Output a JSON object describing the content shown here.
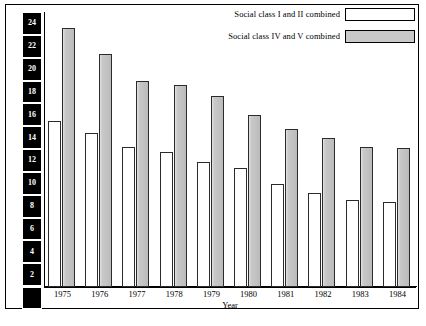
{
  "legend": {
    "items": [
      {
        "label": "Social class I and II combined",
        "swatch": "white"
      },
      {
        "label": "Social class IV and V combined",
        "swatch": "gray"
      }
    ]
  },
  "axes": {
    "ylabel": "Perinatal mortality rates/1000 total births",
    "xlabel": "Year",
    "yticks": [
      "0",
      "2",
      "4",
      "6",
      "8",
      "10",
      "12",
      "14",
      "16",
      "18",
      "20",
      "22",
      "24"
    ]
  },
  "colors": {
    "class_i_ii": "#ffffff",
    "class_iv_v": "#c8c8c8",
    "outline": "#000000"
  },
  "chart_data": {
    "type": "bar",
    "title": "",
    "xlabel": "Year",
    "ylabel": "Perinatal mortality rates/1000 total births",
    "categories": [
      "1975",
      "1976",
      "1977",
      "1978",
      "1979",
      "1980",
      "1981",
      "1982",
      "1983",
      "1984"
    ],
    "series": [
      {
        "name": "Social class I and II combined",
        "values": [
          14.5,
          13.4,
          12.2,
          11.8,
          10.9,
          10.4,
          9.0,
          8.2,
          7.6,
          7.4
        ]
      },
      {
        "name": "Social class IV and V combined",
        "values": [
          22.6,
          20.3,
          18.0,
          17.6,
          16.7,
          15.0,
          13.8,
          13.0,
          12.2,
          12.1
        ]
      }
    ],
    "ylim": [
      0,
      24
    ],
    "ytick_step": 2,
    "grid": false,
    "legend_position": "top-right"
  }
}
